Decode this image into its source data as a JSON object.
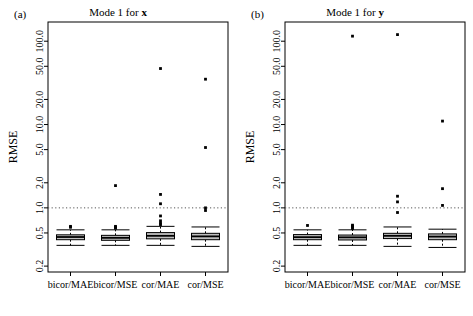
{
  "figure": {
    "width": 473,
    "height": 316,
    "background": "#ffffff",
    "ink": "#000000",
    "box_fill": "#bfbfbf",
    "refline_color": "#555555"
  },
  "panels": [
    {
      "id": "a",
      "tag": "(a)",
      "title_prefix": "Mode 1 for ",
      "title_var": "x",
      "ylabel": "RMSE"
    },
    {
      "id": "b",
      "tag": "(b)",
      "title_prefix": "Mode 1 for ",
      "title_var": "y",
      "ylabel": "RMSE"
    }
  ],
  "chart_data": {
    "type": "box",
    "xlabel": "",
    "ylabel": "RMSE",
    "yscale": "log",
    "ylim": [
      0.17,
      170
    ],
    "yticks": [
      0.2,
      0.5,
      1.0,
      2.0,
      5.0,
      10.0,
      20.0,
      50.0,
      100.0
    ],
    "ytick_labels": [
      "0.2",
      "0.5",
      "1.0",
      "2.0",
      "5.0",
      "10.0",
      "20.0",
      "50.0",
      "100.0"
    ],
    "grid": false,
    "legend": null,
    "reference_line": {
      "y": 1.0,
      "style": "dotted"
    },
    "categories": [
      "bicor/MAE",
      "bicor/MSE",
      "cor/MAE",
      "cor/MSE"
    ],
    "panels": [
      {
        "name": "Mode 1 for x",
        "boxes": [
          {
            "category": "bicor/MAE",
            "whisker_low": 0.355,
            "q1": 0.415,
            "median": 0.447,
            "q3": 0.475,
            "whisker_high": 0.545,
            "outliers": [
              0.585,
              0.6
            ]
          },
          {
            "category": "bicor/MSE",
            "whisker_low": 0.355,
            "q1": 0.408,
            "median": 0.437,
            "q3": 0.468,
            "whisker_high": 0.545,
            "outliers": [
              0.57,
              0.585,
              0.6,
              1.85
            ]
          },
          {
            "category": "cor/MAE",
            "whisker_low": 0.355,
            "q1": 0.425,
            "median": 0.462,
            "q3": 0.505,
            "whisker_high": 0.6,
            "outliers": [
              0.63,
              0.655,
              0.7,
              0.8,
              1.12,
              1.45,
              47.0
            ]
          },
          {
            "category": "cor/MSE",
            "whisker_low": 0.345,
            "q1": 0.415,
            "median": 0.455,
            "q3": 0.495,
            "whisker_high": 0.59,
            "outliers": [
              0.93,
              1.0,
              5.3,
              35.0
            ]
          }
        ]
      },
      {
        "name": "Mode 1 for y",
        "boxes": [
          {
            "category": "bicor/MAE",
            "whisker_low": 0.355,
            "q1": 0.415,
            "median": 0.445,
            "q3": 0.478,
            "whisker_high": 0.545,
            "outliers": [
              0.615
            ]
          },
          {
            "category": "bicor/MSE",
            "whisker_low": 0.355,
            "q1": 0.412,
            "median": 0.443,
            "q3": 0.472,
            "whisker_high": 0.545,
            "outliers": [
              0.565,
              0.585,
              0.605,
              0.62,
              115.0
            ]
          },
          {
            "category": "cor/MAE",
            "whisker_low": 0.345,
            "q1": 0.428,
            "median": 0.462,
            "q3": 0.495,
            "whisker_high": 0.59,
            "outliers": [
              0.88,
              1.18,
              1.38,
              120.0
            ]
          },
          {
            "category": "cor/MSE",
            "whisker_low": 0.335,
            "q1": 0.415,
            "median": 0.452,
            "q3": 0.487,
            "whisker_high": 0.555,
            "outliers": [
              1.07,
              1.7,
              11.0
            ]
          }
        ]
      }
    ]
  }
}
